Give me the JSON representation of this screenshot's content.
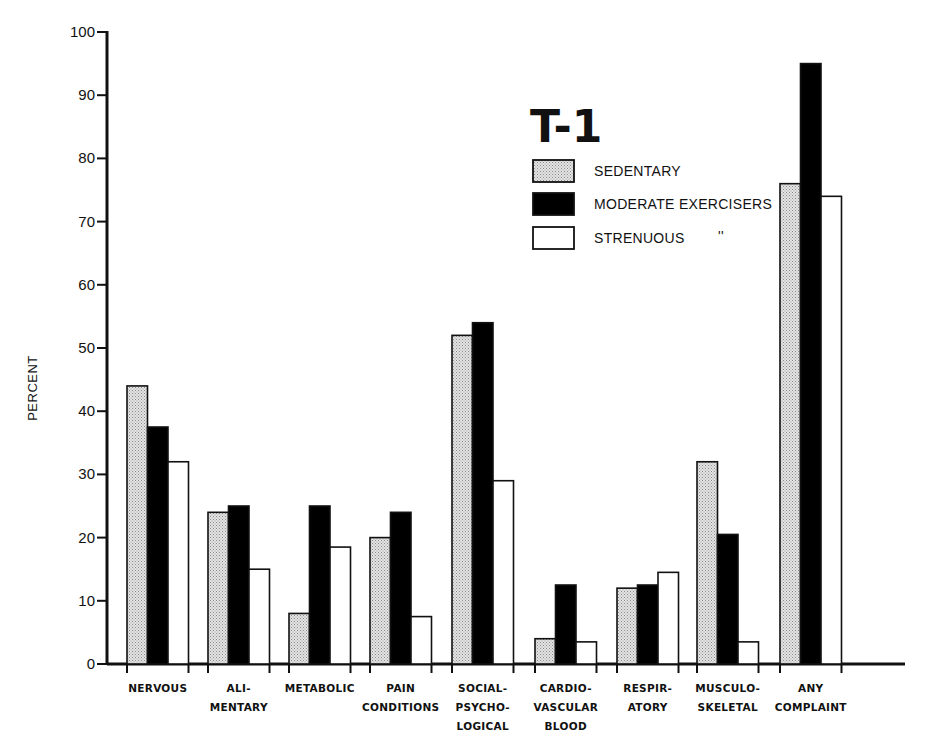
{
  "chart_data": {
    "type": "bar",
    "title": "T-1",
    "xlabel": "",
    "ylabel": "PERCENT",
    "ylim": [
      0,
      100
    ],
    "yticks": [
      0,
      10,
      20,
      30,
      40,
      50,
      60,
      70,
      80,
      90,
      100
    ],
    "grid": false,
    "legend_position": "upper right (inside plot)",
    "categories": [
      [
        "NERVOUS"
      ],
      [
        "ALI-",
        "MENTARY"
      ],
      [
        "METABOLIC"
      ],
      [
        "PAIN",
        "CONDITIONS"
      ],
      [
        "SOCIAL-",
        "PSYCHO-",
        "LOGICAL"
      ],
      [
        "CARDIO-",
        "VASCULAR",
        "BLOOD"
      ],
      [
        "RESPIR-",
        "ATORY"
      ],
      [
        "MUSCULO-",
        "SKELETAL"
      ],
      [
        "ANY",
        "COMPLAINT"
      ]
    ],
    "series": [
      {
        "name": "SEDENTARY",
        "fill": "stipple",
        "values": [
          44,
          24,
          8,
          20,
          52,
          4,
          12,
          32,
          76
        ]
      },
      {
        "name": "MODERATE EXERCISERS",
        "fill": "#000000",
        "values": [
          37.5,
          25,
          25,
          24,
          54,
          12.5,
          12.5,
          20.5,
          95
        ]
      },
      {
        "name": "STRENUOUS",
        "fill": "#ffffff",
        "values": [
          32,
          15,
          18.5,
          7.5,
          29,
          3.5,
          14.5,
          3.5,
          74
        ]
      }
    ],
    "legend_suffix_marks": "''"
  }
}
